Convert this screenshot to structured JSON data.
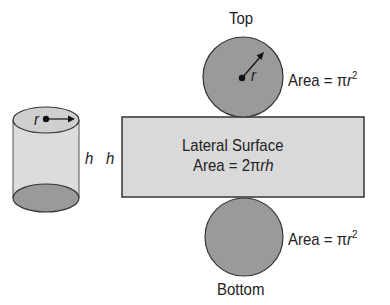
{
  "diagram": {
    "cylinder": {
      "radius_label": "r",
      "height_label": "h"
    },
    "net": {
      "height_label": "h",
      "top": {
        "label": "Top",
        "radius_label": "r",
        "area_prefix": "Area = π",
        "area_var": "r",
        "area_exp": "2"
      },
      "lateral": {
        "label": "Lateral Surface",
        "area_prefix": "Area = 2π",
        "area_var": "rh"
      },
      "bottom": {
        "label": "Bottom",
        "area_prefix": "Area = π",
        "area_var": "r",
        "area_exp": "2"
      }
    },
    "colors": {
      "lateral_fill": "#d9d9d9",
      "circle_fill": "#9a9a9a",
      "cylinder_body": "#dcdcdc",
      "cylinder_top": "#cfcfcf",
      "cylinder_bottom": "#9a9a9a",
      "stroke": "#333333"
    }
  }
}
